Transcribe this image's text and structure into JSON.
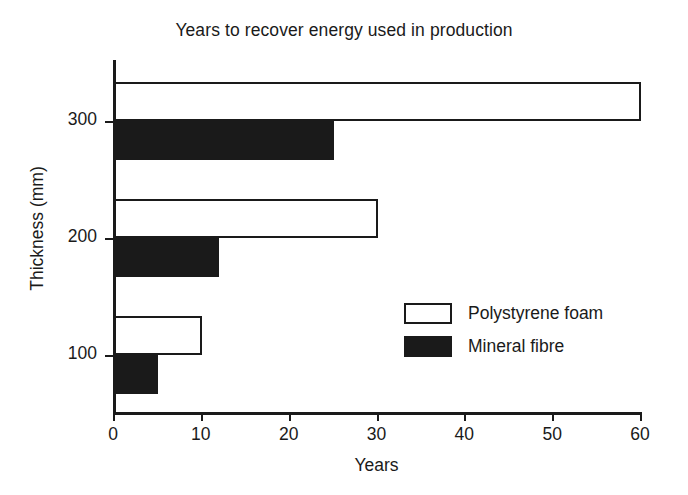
{
  "chart_data": {
    "type": "bar",
    "orientation": "horizontal",
    "title": "Years to recover energy used in production",
    "xlabel": "Years",
    "ylabel": "Thickness (mm)",
    "categories": [
      "100",
      "200",
      "300"
    ],
    "series": [
      {
        "name": "Polystyrene foam",
        "fill": "open",
        "values": [
          10,
          30,
          60
        ]
      },
      {
        "name": "Mineral fibre",
        "fill": "filled",
        "values": [
          5,
          12,
          25
        ]
      }
    ],
    "xlim": [
      0,
      60
    ],
    "xticks": [
      0,
      10,
      20,
      30,
      40,
      50,
      60
    ],
    "xtick_labels": [
      "0",
      "10",
      "20",
      "30",
      "40",
      "50",
      "60"
    ],
    "yticks": [
      100,
      200,
      300
    ],
    "ytick_labels": [
      "100",
      "200",
      "300"
    ],
    "grid": false,
    "legend_position": "center-right",
    "legend": [
      {
        "label": "Polystyrene foam",
        "fill": "open"
      },
      {
        "label": "Mineral fibre",
        "fill": "filled"
      }
    ],
    "colors": {
      "line": "#1a1a1a",
      "filled_bar": "#1a1a1a",
      "open_bar": "#ffffff",
      "background": "#ffffff"
    }
  }
}
